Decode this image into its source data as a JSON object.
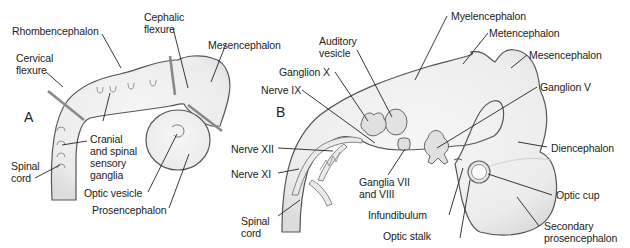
{
  "figure": {
    "panel_a": {
      "letter": "A",
      "labels": {
        "rhombencephalon": "Rhombencephalon",
        "cephalic_flexure_1": "Cephalic",
        "cephalic_flexure_2": "flexure",
        "cervical_flexure_1": "Cervical",
        "cervical_flexure_2": "flexure",
        "mesencephalon": "Mesencephalon",
        "ganglia_1": "Cranial",
        "ganglia_2": "and spinal",
        "ganglia_3": "sensory",
        "ganglia_4": "ganglia",
        "spinal_cord_1": "Spinal",
        "spinal_cord_2": "cord",
        "optic_vesicle": "Optic vesicle",
        "prosencephalon": "Prosencephalon"
      }
    },
    "panel_b": {
      "letter": "B",
      "labels": {
        "myelencephalon": "Myelencephalon",
        "metencephalon": "Metencephalon",
        "mesencephalon": "Mesencephalon",
        "auditory_vesicle_1": "Auditory",
        "auditory_vesicle_2": "vesicle",
        "ganglion_x": "Ganglion X",
        "nerve_ix": "Nerve IX",
        "ganglion_v": "Ganglion V",
        "nerve_xii": "Nerve XII",
        "nerve_xi": "Nerve XI",
        "ganglia_vii_viii_1": "Ganglia VII",
        "ganglia_vii_viii_2": "and VIII",
        "diencephalon": "Diencephalon",
        "spinal_cord_1": "Spinal",
        "spinal_cord_2": "cord",
        "infundibulum": "Infundibulum",
        "optic_cup": "Optic cup",
        "optic_stalk": "Optic stalk",
        "secondary_prosencephalon_1": "Secondary",
        "secondary_prosencephalon_2": "prosencephalon"
      }
    },
    "colors": {
      "outline": "#555555",
      "fill": "#ececec",
      "flexure_bar": "#8a8a8a",
      "leader": "#222222",
      "text": "#222222"
    }
  }
}
